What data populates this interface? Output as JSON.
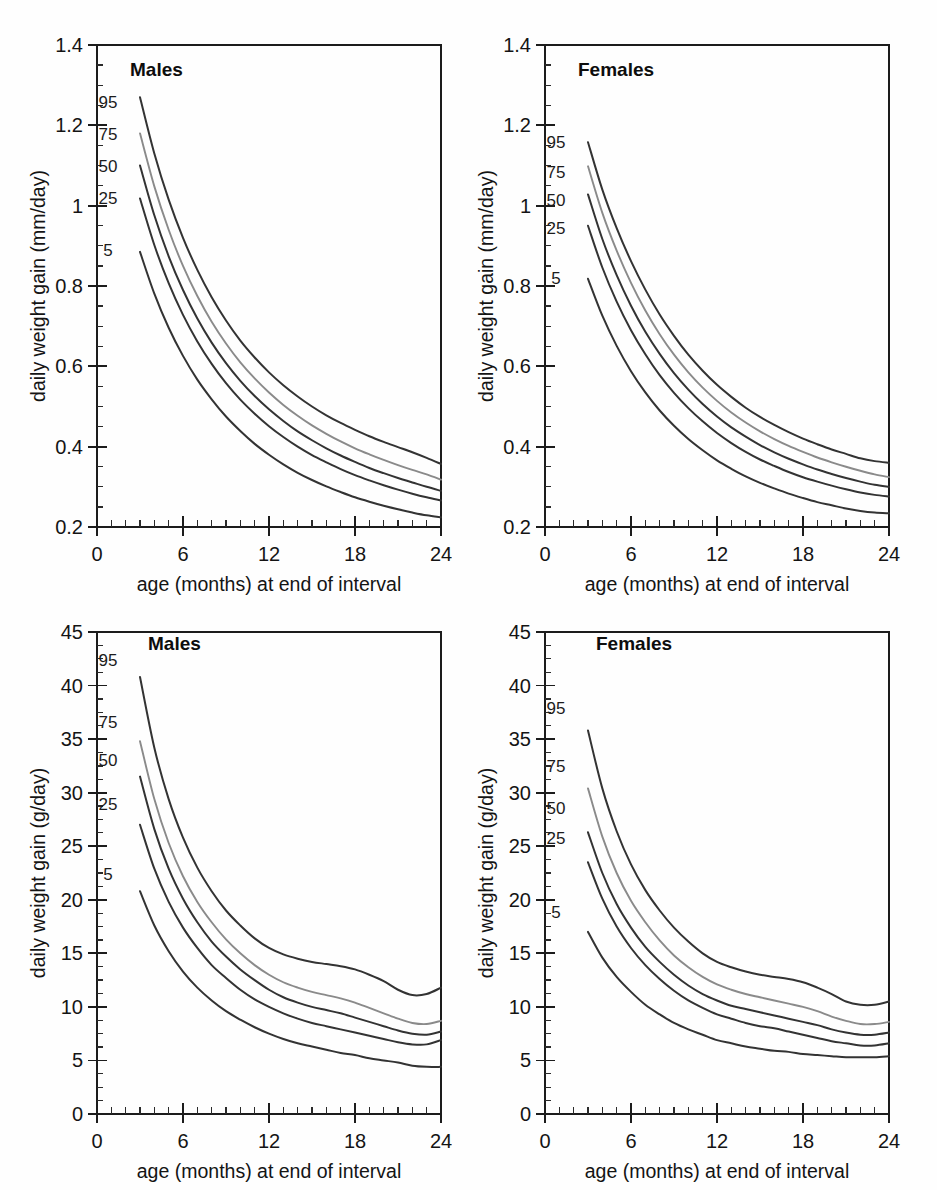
{
  "figure": {
    "background": "#fefefe",
    "panel_count": 4,
    "line_color_dark": "#333333",
    "line_color_light": "#8a8a8a"
  },
  "labels": {
    "xaxis_title": "age (months) at end of interval",
    "yaxis_title_mm": "daily weight gain (mm/day)",
    "yaxis_title_g": "daily weight gain (g/day)",
    "title_males": "Males",
    "title_females": "Females",
    "percentile_95": "95",
    "percentile_75": "75",
    "percentile_50": "50",
    "percentile_25": "25",
    "percentile_5": "5"
  },
  "chart_data": [
    {
      "id": "top-left",
      "type": "line",
      "title": "Males",
      "xlabel": "age (months) at end of interval",
      "ylabel": "daily weight gain (mm/day)",
      "xlim": [
        0,
        24
      ],
      "ylim": [
        0.2,
        1.4
      ],
      "xticks": [
        0,
        6,
        12,
        18,
        24
      ],
      "xticklabels": [
        "0",
        "6",
        "12",
        "18",
        "24"
      ],
      "yticks": [
        0.2,
        0.4,
        0.6,
        0.8,
        1.0,
        1.2,
        1.4
      ],
      "yticklabels": [
        "0.2",
        "0.4",
        "0.6",
        "0.8",
        "1",
        "1.2",
        "1.4"
      ],
      "x_minor_step": 1,
      "y_minor_step": 0.05,
      "grid": false,
      "legend": "inline-curve-labels",
      "x": [
        3,
        4,
        5,
        6,
        7,
        8,
        9,
        10,
        11,
        12,
        13,
        14,
        15,
        16,
        17,
        18,
        19,
        20,
        21,
        22,
        23,
        24
      ],
      "series": [
        {
          "name": "95",
          "label": "95",
          "color": "#333333",
          "values": [
            1.27,
            1.13,
            1.015,
            0.92,
            0.84,
            0.772,
            0.714,
            0.664,
            0.622,
            0.585,
            0.553,
            0.525,
            0.5,
            0.478,
            0.459,
            0.442,
            0.426,
            0.412,
            0.399,
            0.386,
            0.372,
            0.357
          ]
        },
        {
          "name": "75",
          "label": "75",
          "color": "#8a8a8a",
          "values": [
            1.18,
            1.048,
            0.94,
            0.85,
            0.775,
            0.711,
            0.657,
            0.61,
            0.57,
            0.535,
            0.504,
            0.477,
            0.453,
            0.432,
            0.413,
            0.396,
            0.381,
            0.367,
            0.354,
            0.342,
            0.331,
            0.318
          ]
        },
        {
          "name": "50",
          "label": "50",
          "color": "#333333",
          "values": [
            1.1,
            0.976,
            0.874,
            0.79,
            0.719,
            0.659,
            0.608,
            0.564,
            0.526,
            0.493,
            0.464,
            0.438,
            0.416,
            0.396,
            0.378,
            0.362,
            0.347,
            0.334,
            0.322,
            0.311,
            0.3,
            0.29
          ]
        },
        {
          "name": "25",
          "label": "25",
          "color": "#333333",
          "values": [
            1.018,
            0.902,
            0.807,
            0.728,
            0.662,
            0.606,
            0.558,
            0.517,
            0.482,
            0.451,
            0.424,
            0.4,
            0.379,
            0.361,
            0.344,
            0.329,
            0.316,
            0.304,
            0.293,
            0.283,
            0.274,
            0.266
          ]
        },
        {
          "name": "5",
          "label": "5",
          "color": "#333333",
          "values": [
            0.885,
            0.781,
            0.696,
            0.626,
            0.567,
            0.518,
            0.475,
            0.439,
            0.407,
            0.38,
            0.356,
            0.335,
            0.317,
            0.301,
            0.287,
            0.274,
            0.263,
            0.253,
            0.244,
            0.236,
            0.229,
            0.224
          ]
        }
      ]
    },
    {
      "id": "top-right",
      "type": "line",
      "title": "Females",
      "xlabel": "age (months) at end of interval",
      "ylabel": "daily weight gain (mm/day)",
      "xlim": [
        0,
        24
      ],
      "ylim": [
        0.2,
        1.4
      ],
      "xticks": [
        0,
        6,
        12,
        18,
        24
      ],
      "xticklabels": [
        "0",
        "6",
        "12",
        "18",
        "24"
      ],
      "yticks": [
        0.2,
        0.4,
        0.6,
        0.8,
        1.0,
        1.2,
        1.4
      ],
      "yticklabels": [
        "0.2",
        "0.4",
        "0.6",
        "0.8",
        "1",
        "1.2",
        "1.4"
      ],
      "x_minor_step": 1,
      "y_minor_step": 0.05,
      "grid": false,
      "legend": "inline-curve-labels",
      "x": [
        3,
        4,
        5,
        6,
        7,
        8,
        9,
        10,
        11,
        12,
        13,
        14,
        15,
        16,
        17,
        18,
        19,
        20,
        21,
        22,
        23,
        24
      ],
      "series": [
        {
          "name": "95",
          "label": "95",
          "color": "#333333",
          "values": [
            1.158,
            1.04,
            0.944,
            0.862,
            0.791,
            0.729,
            0.676,
            0.629,
            0.589,
            0.554,
            0.524,
            0.497,
            0.474,
            0.454,
            0.436,
            0.42,
            0.406,
            0.393,
            0.382,
            0.371,
            0.364,
            0.36
          ]
        },
        {
          "name": "75",
          "label": "75",
          "color": "#8a8a8a",
          "values": [
            1.098,
            0.982,
            0.888,
            0.808,
            0.739,
            0.68,
            0.629,
            0.585,
            0.547,
            0.514,
            0.485,
            0.46,
            0.438,
            0.419,
            0.402,
            0.387,
            0.373,
            0.361,
            0.35,
            0.34,
            0.331,
            0.324
          ]
        },
        {
          "name": "50",
          "label": "50",
          "color": "#333333",
          "values": [
            1.028,
            0.917,
            0.827,
            0.751,
            0.686,
            0.631,
            0.583,
            0.542,
            0.506,
            0.475,
            0.448,
            0.425,
            0.404,
            0.386,
            0.37,
            0.356,
            0.343,
            0.332,
            0.322,
            0.313,
            0.305,
            0.3
          ]
        },
        {
          "name": "25",
          "label": "25",
          "color": "#333333",
          "values": [
            0.95,
            0.846,
            0.761,
            0.69,
            0.63,
            0.578,
            0.534,
            0.496,
            0.463,
            0.434,
            0.409,
            0.387,
            0.368,
            0.352,
            0.337,
            0.324,
            0.313,
            0.303,
            0.294,
            0.286,
            0.28,
            0.276
          ]
        },
        {
          "name": "5",
          "label": "5",
          "color": "#333333",
          "values": [
            0.818,
            0.726,
            0.651,
            0.588,
            0.535,
            0.49,
            0.452,
            0.419,
            0.391,
            0.366,
            0.345,
            0.326,
            0.31,
            0.296,
            0.283,
            0.272,
            0.262,
            0.254,
            0.246,
            0.24,
            0.236,
            0.234
          ]
        }
      ]
    },
    {
      "id": "bottom-left",
      "type": "line",
      "title": "Males",
      "xlabel": "age (months) at end of interval",
      "ylabel": "daily weight gain (g/day)",
      "xlim": [
        0,
        24
      ],
      "ylim": [
        0,
        45
      ],
      "xticks": [
        0,
        6,
        12,
        18,
        24
      ],
      "xticklabels": [
        "0",
        "6",
        "12",
        "18",
        "24"
      ],
      "yticks": [
        0,
        5,
        10,
        15,
        20,
        25,
        30,
        35,
        40,
        45
      ],
      "yticklabels": [
        "0",
        "5",
        "10",
        "15",
        "20",
        "25",
        "30",
        "35",
        "40",
        "45"
      ],
      "x_minor_step": 1,
      "y_minor_step": 1.25,
      "grid": false,
      "legend": "inline-curve-labels",
      "x": [
        3,
        4,
        5,
        6,
        7,
        8,
        9,
        10,
        11,
        12,
        13,
        14,
        15,
        16,
        17,
        18,
        19,
        20,
        21,
        22,
        23,
        24
      ],
      "series": [
        {
          "name": "95",
          "label": "95",
          "color": "#333333",
          "values": [
            40.8,
            34.2,
            29.4,
            25.8,
            23.0,
            20.8,
            19.0,
            17.6,
            16.4,
            15.5,
            14.9,
            14.5,
            14.2,
            14.0,
            13.8,
            13.5,
            13.0,
            12.4,
            11.6,
            11.1,
            11.2,
            11.8
          ]
        },
        {
          "name": "75",
          "label": "75",
          "color": "#8a8a8a",
          "values": [
            34.8,
            29.4,
            25.3,
            22.2,
            19.8,
            17.9,
            16.3,
            15.0,
            13.9,
            13.0,
            12.3,
            11.8,
            11.4,
            11.1,
            10.8,
            10.4,
            9.9,
            9.4,
            8.9,
            8.5,
            8.4,
            8.7
          ]
        },
        {
          "name": "50",
          "label": "50",
          "color": "#333333",
          "values": [
            31.5,
            26.6,
            22.9,
            20.1,
            17.9,
            16.1,
            14.7,
            13.5,
            12.5,
            11.6,
            10.9,
            10.4,
            10.0,
            9.7,
            9.4,
            9.0,
            8.6,
            8.2,
            7.8,
            7.5,
            7.4,
            7.7
          ]
        },
        {
          "name": "25",
          "label": "25",
          "color": "#333333",
          "values": [
            27.0,
            22.9,
            19.8,
            17.4,
            15.5,
            13.9,
            12.7,
            11.6,
            10.7,
            10.0,
            9.4,
            8.9,
            8.5,
            8.2,
            7.9,
            7.6,
            7.3,
            7.0,
            6.7,
            6.5,
            6.5,
            6.9
          ]
        },
        {
          "name": "5",
          "label": "5",
          "color": "#333333",
          "values": [
            20.8,
            17.6,
            15.2,
            13.3,
            11.8,
            10.6,
            9.6,
            8.8,
            8.1,
            7.5,
            7.0,
            6.6,
            6.3,
            6.0,
            5.7,
            5.5,
            5.2,
            5.0,
            4.8,
            4.5,
            4.4,
            4.4
          ]
        }
      ]
    },
    {
      "id": "bottom-right",
      "type": "line",
      "title": "Females",
      "xlabel": "age (months) at end of interval",
      "ylabel": "daily weight gain (g/day)",
      "xlim": [
        0,
        24
      ],
      "ylim": [
        0,
        45
      ],
      "xticks": [
        0,
        6,
        12,
        18,
        24
      ],
      "xticklabels": [
        "0",
        "6",
        "12",
        "18",
        "24"
      ],
      "yticks": [
        0,
        5,
        10,
        15,
        20,
        25,
        30,
        35,
        40,
        45
      ],
      "yticklabels": [
        "0",
        "5",
        "10",
        "15",
        "20",
        "25",
        "30",
        "35",
        "40",
        "45"
      ],
      "x_minor_step": 1,
      "y_minor_step": 1.25,
      "grid": false,
      "legend": "inline-curve-labels",
      "x": [
        3,
        4,
        5,
        6,
        7,
        8,
        9,
        10,
        11,
        12,
        13,
        14,
        15,
        16,
        17,
        18,
        19,
        20,
        21,
        22,
        23,
        24
      ],
      "series": [
        {
          "name": "95",
          "label": "95",
          "color": "#333333",
          "values": [
            35.8,
            30.4,
            26.4,
            23.3,
            20.9,
            19.0,
            17.4,
            16.1,
            15.0,
            14.2,
            13.7,
            13.3,
            13.0,
            12.8,
            12.6,
            12.3,
            11.8,
            11.2,
            10.5,
            10.2,
            10.2,
            10.5
          ]
        },
        {
          "name": "75",
          "label": "75",
          "color": "#8a8a8a",
          "values": [
            30.4,
            25.9,
            22.5,
            19.9,
            17.9,
            16.2,
            14.8,
            13.7,
            12.8,
            12.1,
            11.6,
            11.2,
            10.9,
            10.6,
            10.3,
            10.0,
            9.6,
            9.1,
            8.7,
            8.4,
            8.4,
            8.6
          ]
        },
        {
          "name": "50",
          "label": "50",
          "color": "#333333",
          "values": [
            26.3,
            22.5,
            19.6,
            17.4,
            15.6,
            14.2,
            13.0,
            12.0,
            11.2,
            10.6,
            10.1,
            9.8,
            9.5,
            9.2,
            8.9,
            8.6,
            8.3,
            7.9,
            7.6,
            7.4,
            7.4,
            7.6
          ]
        },
        {
          "name": "25",
          "label": "25",
          "color": "#333333",
          "values": [
            23.5,
            20.1,
            17.5,
            15.5,
            13.9,
            12.6,
            11.5,
            10.6,
            9.9,
            9.3,
            8.9,
            8.5,
            8.2,
            8.0,
            7.7,
            7.4,
            7.1,
            6.8,
            6.6,
            6.4,
            6.4,
            6.6
          ]
        },
        {
          "name": "5",
          "label": "5",
          "color": "#333333",
          "values": [
            17.0,
            14.6,
            12.8,
            11.4,
            10.2,
            9.3,
            8.5,
            7.9,
            7.4,
            6.9,
            6.6,
            6.3,
            6.1,
            5.9,
            5.8,
            5.6,
            5.5,
            5.4,
            5.3,
            5.3,
            5.3,
            5.4
          ]
        }
      ]
    }
  ]
}
